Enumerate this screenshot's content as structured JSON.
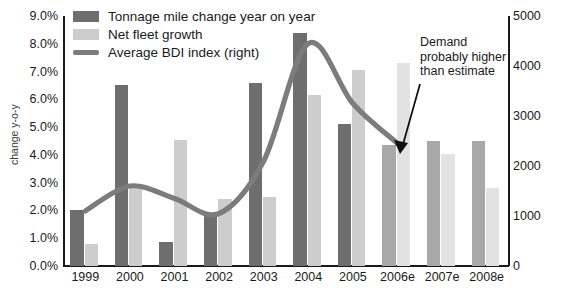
{
  "chart_data": {
    "type": "bar",
    "title": "",
    "xlabel": "",
    "ylabel": "change y-o-y",
    "y2label": "",
    "categories": [
      "1999",
      "2000",
      "2001",
      "2002",
      "2003",
      "2004",
      "2005",
      "2006e",
      "2007e",
      "2008e"
    ],
    "ylim": [
      0,
      9
    ],
    "y2lim": [
      0,
      5000
    ],
    "ytick_labels": [
      "0.0%",
      "1.0%",
      "2.0%",
      "3.0%",
      "4.0%",
      "5.0%",
      "6.0%",
      "7.0%",
      "8.0%",
      "9.0%"
    ],
    "ytick_values": [
      0,
      1,
      2,
      3,
      4,
      5,
      6,
      7,
      8,
      9
    ],
    "y2tick_labels": [
      "0",
      "1000",
      "2000",
      "3000",
      "4000",
      "5000"
    ],
    "y2tick_values": [
      0,
      1000,
      2000,
      3000,
      4000,
      5000
    ],
    "grid": false,
    "legend_position": "top-left",
    "series": [
      {
        "name": "Tonnage mile change year on year",
        "type": "bar",
        "axis": "left",
        "color": "#6e6e6e",
        "forecast_color": "#a8a8a8",
        "values": [
          2.0,
          6.5,
          0.85,
          1.9,
          6.6,
          8.4,
          5.1,
          4.35,
          4.5,
          4.5
        ]
      },
      {
        "name": "Net fleet growth",
        "type": "bar",
        "axis": "left",
        "color": "#cdcdcd",
        "forecast_color": "#e2e2e2",
        "values": [
          0.8,
          2.8,
          4.55,
          2.4,
          2.5,
          6.15,
          7.05,
          7.3,
          4.05,
          2.8
        ]
      },
      {
        "name": "Average BDI index (right)",
        "type": "line",
        "axis": "right",
        "color": "#7c7c7c",
        "values": [
          1100,
          1600,
          1350,
          1050,
          2100,
          4450,
          3250,
          2450,
          null,
          null
        ]
      }
    ],
    "annotations": [
      {
        "text": "Demand probably higher than estimate",
        "lines": [
          "Demand",
          "probably higher",
          "than estimate"
        ],
        "points_to": "2006e tonnage mile change bar"
      }
    ]
  },
  "legend": {
    "items": [
      {
        "label": "Tonnage mile change year on year",
        "marker": "swatch-dark"
      },
      {
        "label": "Net fleet growth",
        "marker": "swatch-light"
      },
      {
        "label": "Average BDI index (right)",
        "marker": "line"
      }
    ]
  },
  "annotation": {
    "line1": "Demand",
    "line2": "probably higher",
    "line3": "than estimate"
  }
}
